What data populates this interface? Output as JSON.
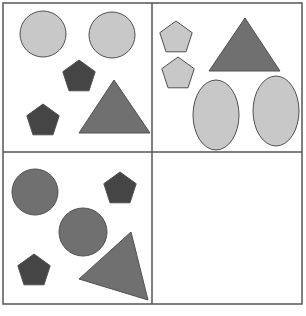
{
  "figure": {
    "width": 306,
    "height": 316,
    "background": "#ffffff",
    "grid": {
      "x0": 3,
      "y0": 3,
      "x1": 302,
      "y1": 304,
      "mid_x": 152,
      "mid_y": 152,
      "line_color": "#555555",
      "line_width": 1.5
    },
    "colors": {
      "light": "#c8c8c8",
      "medium": "#707070",
      "dark": "#454545",
      "outline": "#505050"
    },
    "panels": [
      {
        "id": "top-left",
        "shapes": [
          {
            "type": "circle",
            "name": "light-circle-1",
            "cx": 43,
            "cy": 34,
            "r": 23,
            "fill": "light"
          },
          {
            "type": "circle",
            "name": "light-circle-2",
            "cx": 112,
            "cy": 35,
            "r": 23,
            "fill": "light"
          },
          {
            "type": "pentagon",
            "name": "dark-pentagon-1",
            "cx": 79,
            "cy": 77,
            "r": 17,
            "fill": "dark"
          },
          {
            "type": "pentagon",
            "name": "dark-pentagon-2",
            "cx": 43,
            "cy": 121,
            "r": 17,
            "fill": "dark"
          },
          {
            "type": "polygon",
            "name": "medium-triangle",
            "points": [
              [
                114,
                80
              ],
              [
                150,
                133
              ],
              [
                79,
                133
              ]
            ],
            "fill": "medium"
          }
        ]
      },
      {
        "id": "top-right",
        "shapes": [
          {
            "type": "pentagon",
            "name": "light-pentagon-1",
            "cx": 176,
            "cy": 38,
            "r": 17,
            "fill": "light"
          },
          {
            "type": "pentagon",
            "name": "light-pentagon-2",
            "cx": 178,
            "cy": 74,
            "r": 17,
            "fill": "light"
          },
          {
            "type": "polygon",
            "name": "medium-triangle",
            "points": [
              [
                245,
                18
              ],
              [
                280,
                71
              ],
              [
                209,
                71
              ]
            ],
            "fill": "medium"
          },
          {
            "type": "ellipse",
            "name": "light-oval-1",
            "cx": 216,
            "cy": 115,
            "rx": 23,
            "ry": 35,
            "fill": "light"
          },
          {
            "type": "ellipse",
            "name": "light-oval-2",
            "cx": 276,
            "cy": 111,
            "rx": 23,
            "ry": 35,
            "fill": "light"
          }
        ]
      },
      {
        "id": "bottom-left",
        "shapes": [
          {
            "type": "circle",
            "name": "medium-circle-1",
            "cx": 35,
            "cy": 192,
            "r": 23,
            "fill": "medium"
          },
          {
            "type": "circle",
            "name": "medium-circle-2",
            "cx": 83,
            "cy": 232,
            "r": 24,
            "fill": "medium"
          },
          {
            "type": "pentagon",
            "name": "dark-pentagon-1",
            "cx": 120,
            "cy": 189,
            "r": 17,
            "fill": "dark"
          },
          {
            "type": "pentagon",
            "name": "dark-pentagon-2",
            "cx": 34,
            "cy": 271,
            "r": 17,
            "fill": "dark"
          },
          {
            "type": "polygon",
            "name": "medium-triangle",
            "points": [
              [
                131,
                232
              ],
              [
                148,
                300
              ],
              [
                79,
                279
              ]
            ],
            "fill": "medium"
          }
        ]
      },
      {
        "id": "bottom-right",
        "shapes": []
      }
    ]
  }
}
